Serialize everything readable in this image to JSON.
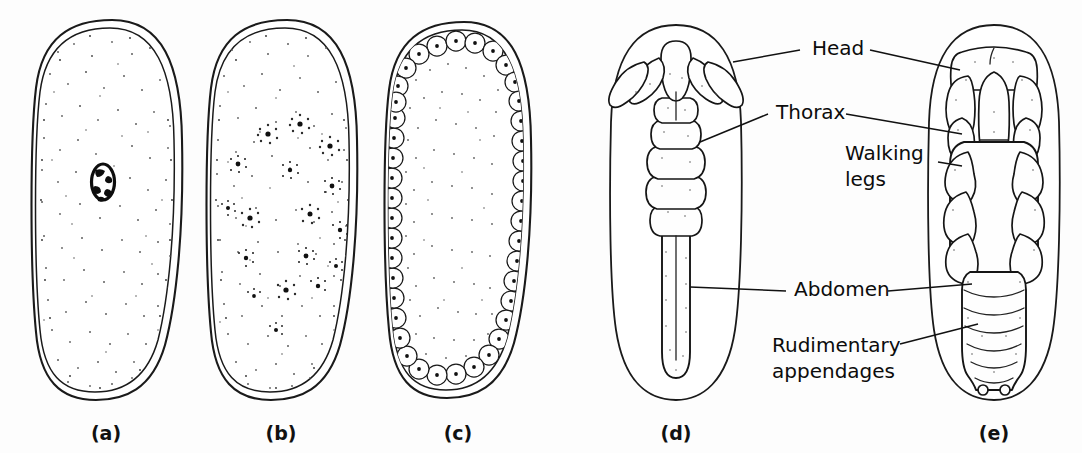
{
  "figure": {
    "background_color": "#fdfdfd",
    "ink_color": "#111111",
    "panels": [
      {
        "id": "a",
        "caption": "(a)",
        "stage": "zygote",
        "description": "Egg with single centrally placed zygote nucleus in yolk",
        "nuclei_count": 1
      },
      {
        "id": "b",
        "caption": "(b)",
        "stage": "cleavage-energids",
        "description": "Egg with many cleavage nuclei distributed through the yolk",
        "nuclei_count": 17
      },
      {
        "id": "c",
        "caption": "(c)",
        "stage": "blastoderm",
        "description": "Cellular blastoderm: nuclei migrated to periphery forming a cell layer",
        "nuclei_count": 46
      },
      {
        "id": "d",
        "caption": "(d)",
        "stage": "germ-band",
        "description": "Early germ band embryo with head lobes, thoracic segments and elongate abdomen",
        "nuclei_count": 0
      },
      {
        "id": "e",
        "caption": "(e)",
        "stage": "segmented-embryo",
        "description": "Later embryo with developed head, thoracic walking legs and segmented abdomen",
        "nuclei_count": 0
      }
    ],
    "labels": [
      {
        "id": "head",
        "text": "Head",
        "text_x": 812,
        "text_y": 55,
        "lines": 1
      },
      {
        "id": "thorax",
        "text": "Thorax",
        "text_x": 776,
        "text_y": 119,
        "lines": 1
      },
      {
        "id": "walking-legs",
        "text_line_1": "Walking",
        "text_line_2": "legs",
        "text_x": 845,
        "text_y": 160,
        "lines": 2
      },
      {
        "id": "abdomen",
        "text": "Abdomen",
        "text_x": 794,
        "text_y": 296,
        "lines": 1
      },
      {
        "id": "rudimentary-appendages",
        "text_line_1": "Rudimentary",
        "text_line_2": "appendages",
        "text_x": 772,
        "text_y": 352,
        "lines": 2
      }
    ]
  }
}
